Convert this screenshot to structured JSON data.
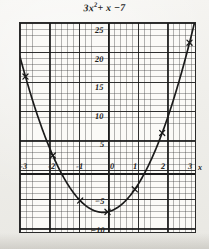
{
  "chart_data": {
    "type": "line",
    "equation": "y = 3x² + x − 7",
    "xlabel": "x",
    "ylabel": "",
    "xlim": [
      -3.2,
      3.2
    ],
    "ylim": [
      -10.5,
      26.5
    ],
    "xticks": [
      -3,
      -2,
      -1,
      0,
      1,
      2,
      3
    ],
    "xtick_labels": [
      "-3",
      "-2",
      "-1",
      "0",
      "1",
      "2",
      "3"
    ],
    "yticks": [
      -10,
      -5,
      5,
      10,
      15,
      20,
      25
    ],
    "ytick_labels": [
      "−10",
      "−5",
      "5",
      "10",
      "15",
      "20",
      "25"
    ],
    "origin_label": "0",
    "grid": true,
    "grid_minor": true,
    "legend": null,
    "marker": "x",
    "points": [
      {
        "x": -3,
        "y": 17
      },
      {
        "x": -2,
        "y": 3
      },
      {
        "x": -1,
        "y": -5
      },
      {
        "x": 0,
        "y": -7
      },
      {
        "x": 1,
        "y": -3
      },
      {
        "x": 2,
        "y": 7
      },
      {
        "x": 3,
        "y": 23
      }
    ],
    "vertex": {
      "x": -0.1667,
      "y": -7.0833
    },
    "roots": [
      -1.6871,
      1.3538
    ],
    "curve_color": "#1a1a1a",
    "grid_color": "#3c3c3c",
    "axis_color": "#1c1c1c",
    "background_color": "#fbfaf7"
  },
  "figure": {
    "caption": "",
    "paper_background": "#f1f0ec"
  }
}
